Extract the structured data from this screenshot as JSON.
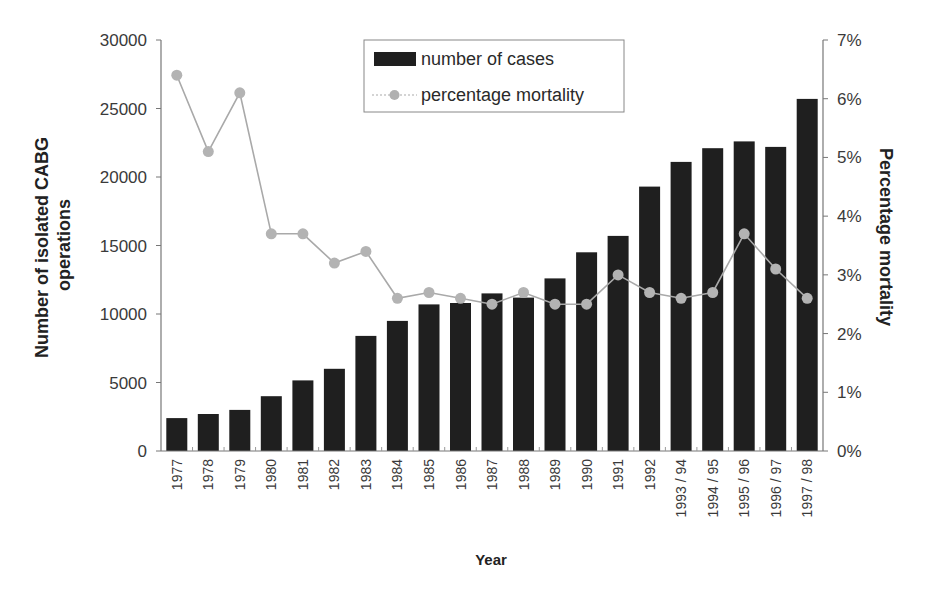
{
  "chart_data": {
    "type": "bar",
    "title": "",
    "xlabel": "Year",
    "ylabel": "Number of isolated CABG operations",
    "ylabel_lines": [
      "Number of isolated CABG",
      "operations"
    ],
    "y2label": "Percentage mortality",
    "categories": [
      "1977",
      "1978",
      "1979",
      "1980",
      "1981",
      "1982",
      "1983",
      "1984",
      "1985",
      "1986",
      "1987",
      "1988",
      "1989",
      "1990",
      "1991",
      "1992",
      "1993 / 94",
      "1994 / 95",
      "1995 / 96",
      "1996 / 97",
      "1997 / 98"
    ],
    "series": [
      {
        "name": "number of cases",
        "type": "bar",
        "axis": "left",
        "color": "#1f1f1f",
        "values": [
          2400,
          2700,
          3000,
          4000,
          5150,
          6000,
          8400,
          9500,
          10700,
          10800,
          11500,
          11200,
          12600,
          14500,
          15700,
          19300,
          21100,
          22100,
          22600,
          22200,
          25700
        ]
      },
      {
        "name": "percentage mortality",
        "type": "line",
        "axis": "right",
        "color": "#a9a9a9",
        "values": [
          6.4,
          5.1,
          6.1,
          3.7,
          3.7,
          3.2,
          3.4,
          2.6,
          2.7,
          2.6,
          2.5,
          2.7,
          2.5,
          2.5,
          3.0,
          2.7,
          2.6,
          2.7,
          3.7,
          3.1,
          2.6
        ]
      }
    ],
    "ylim": [
      0,
      30000
    ],
    "y_ticks": [
      0,
      5000,
      10000,
      15000,
      20000,
      25000,
      30000
    ],
    "y_tick_labels": [
      "0",
      "5000",
      "10000",
      "15000",
      "20000",
      "25000",
      "30000"
    ],
    "y2lim": [
      0,
      7
    ],
    "y2_ticks": [
      0,
      1,
      2,
      3,
      4,
      5,
      6,
      7
    ],
    "y2_tick_labels": [
      "0%",
      "1%",
      "2%",
      "3%",
      "4%",
      "5%",
      "6%",
      "7%"
    ],
    "grid": false,
    "legend": {
      "position": "top-center-inside",
      "entries": [
        "number of cases",
        "percentage mortality"
      ]
    }
  }
}
